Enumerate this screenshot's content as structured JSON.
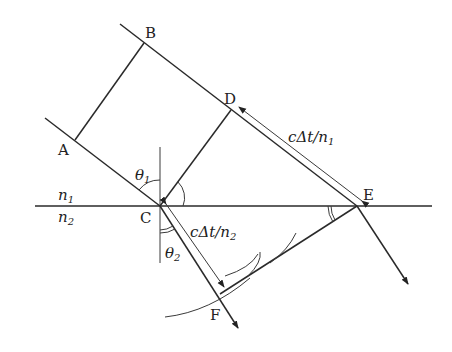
{
  "diagram": {
    "points": {
      "A": "A",
      "B": "B",
      "C": "C",
      "D": "D",
      "E": "E",
      "F": "F"
    },
    "media": {
      "upper": {
        "n": "n",
        "sub": "1"
      },
      "lower": {
        "n": "n",
        "sub": "2"
      }
    },
    "angles": {
      "incidence": {
        "sym": "θ",
        "sub": "1"
      },
      "refraction": {
        "sym": "θ",
        "sub": "2"
      }
    },
    "distances": {
      "DE": {
        "prefix": "cΔt/n",
        "sub": "1"
      },
      "CF": {
        "prefix": "cΔt/n",
        "sub": "2"
      }
    }
  }
}
